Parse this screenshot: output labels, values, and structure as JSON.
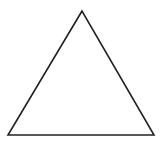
{
  "diagram": {
    "shape": "triangle",
    "kind": "equilateral-outline",
    "background": "#ffffff",
    "stroke_color": "#222222",
    "stroke_width": 1.6,
    "fill": "none",
    "vertices": {
      "apex": [
        82,
        11
      ],
      "bottom_left": [
        8,
        135
      ],
      "bottom_right": [
        154,
        135
      ]
    }
  }
}
